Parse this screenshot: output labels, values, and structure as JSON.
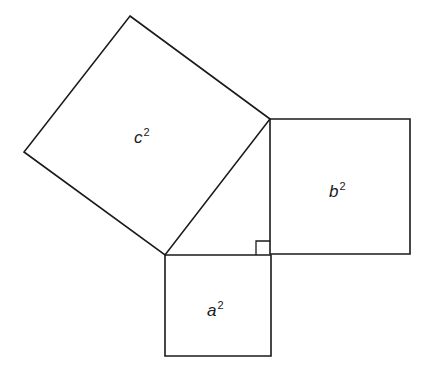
{
  "diagram": {
    "stroke_color": "#1a1a1a",
    "background": "#ffffff",
    "squares": [
      {
        "id": "c-squared",
        "base": "c",
        "exponent": "2",
        "points": "130,16 270,119 165,255 24,152",
        "label_pos": {
          "x": 134,
          "y": 127
        }
      },
      {
        "id": "b-squared",
        "base": "b",
        "exponent": "2",
        "points": "270,119 410,119 410,254 270,254",
        "label_pos": {
          "x": 329,
          "y": 181
        }
      },
      {
        "id": "a-squared",
        "base": "a",
        "exponent": "2",
        "points": "165,255 271,255 271,356 165,356",
        "label_pos": {
          "x": 207,
          "y": 300
        }
      }
    ],
    "right_angle_marker": {
      "points": "256,255 256,241 270,241"
    }
  }
}
